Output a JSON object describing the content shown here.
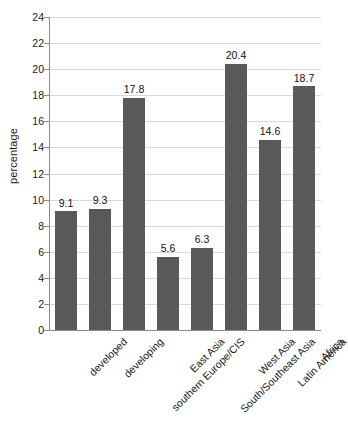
{
  "chart_data": {
    "type": "bar",
    "title": "",
    "subtitle": "",
    "xlabel": "",
    "ylabel": "percentage",
    "categories": [
      "developed",
      "developing",
      "southern Europe/CIS",
      "East Asia",
      "South/Southeast Asia",
      "West Asia",
      "Latin America",
      "Africa"
    ],
    "values": [
      9.1,
      9.3,
      17.8,
      5.6,
      6.3,
      20.4,
      14.6,
      18.7
    ],
    "value_labels": [
      "9.1",
      "9.3",
      "17.8",
      "5.6",
      "6.3",
      "20.4",
      "14.6",
      "18.7"
    ],
    "ylim": [
      0,
      24
    ],
    "ytick_values": [
      0,
      2,
      4,
      6,
      8,
      10,
      12,
      14,
      16,
      18,
      20,
      22,
      24
    ],
    "ytick_labels": [
      "0",
      "2",
      "4",
      "6",
      "8",
      "10",
      "12",
      "14",
      "16",
      "18",
      "20",
      "22",
      "24"
    ],
    "grid": "horizontal",
    "legend": "none",
    "series": [
      {
        "name": "percentage",
        "values": [
          9.1,
          9.3,
          17.8,
          5.6,
          6.3,
          20.4,
          14.6,
          18.7
        ]
      }
    ],
    "colors": {
      "bar_fill": "#595959",
      "gridline": "#d9d9d9",
      "axis": "#8c8c8c",
      "text": "#1a1a1a",
      "background": "#ffffff"
    }
  }
}
